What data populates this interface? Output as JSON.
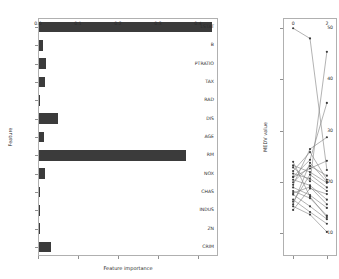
{
  "figure": {
    "width": 339,
    "height": 279,
    "background": "#ffffff",
    "bar_color": "#3b3b3b",
    "line_color": "#7f7f7f",
    "marker_color": "#3b3b3b"
  },
  "chart_data": [
    {
      "type": "bar",
      "orientation": "horizontal",
      "title": "",
      "xlabel": "Feature importance",
      "ylabel": "Feature",
      "xlim": [
        0.0,
        0.45
      ],
      "xticks": [
        0.0,
        0.1,
        0.2,
        0.3,
        0.4
      ],
      "xticklabels": [
        "0.0",
        "0.1",
        "0.2",
        "0.3",
        "0.4"
      ],
      "grid": false,
      "categories": [
        "LSTAT",
        "B",
        "PTRATIO",
        "TAX",
        "RAD",
        "DIS",
        "AGE",
        "RM",
        "NOX",
        "CHAS",
        "INDUS",
        "ZN",
        "CRIM"
      ],
      "values": [
        0.432,
        0.011,
        0.018,
        0.016,
        0.002,
        0.047,
        0.012,
        0.368,
        0.014,
        0.001,
        0.003,
        0.0005,
        0.031
      ]
    },
    {
      "type": "line",
      "title": "",
      "xlabel": "",
      "ylabel": "MEDV value",
      "xlim": [
        -0.6,
        2.6
      ],
      "ylim": [
        5.5,
        52
      ],
      "xticks": [
        0,
        2
      ],
      "xticklabels": [
        "0",
        "2"
      ],
      "yticks": [
        10,
        20,
        30,
        40,
        50
      ],
      "yticklabels": [
        "10",
        "20",
        "30",
        "40",
        "50"
      ],
      "grid": false,
      "marker": "o",
      "series": [
        {
          "name": "s1",
          "x": [
            0,
            1,
            2
          ],
          "values": [
            50.0,
            48.0,
            22.3
          ]
        },
        {
          "name": "s2",
          "x": [
            0,
            1,
            2
          ],
          "values": [
            23.2,
            21.9,
            19.8
          ]
        },
        {
          "name": "s3",
          "x": [
            0,
            1,
            2
          ],
          "values": [
            22.1,
            25.8,
            20.4
          ]
        },
        {
          "name": "s4",
          "x": [
            0,
            1,
            2
          ],
          "values": [
            21.6,
            20.6,
            18.2
          ]
        },
        {
          "name": "s5",
          "x": [
            0,
            1,
            2
          ],
          "values": [
            20.4,
            19.3,
            16.5
          ]
        },
        {
          "name": "s6",
          "x": [
            0,
            1,
            2
          ],
          "values": [
            19.9,
            23.1,
            21.2
          ]
        },
        {
          "name": "s7",
          "x": [
            0,
            1,
            2
          ],
          "values": [
            18.9,
            17.4,
            14.9
          ]
        },
        {
          "name": "s8",
          "x": [
            0,
            1,
            2
          ],
          "values": [
            18.2,
            16.8,
            13.4
          ]
        },
        {
          "name": "s9",
          "x": [
            0,
            1,
            2
          ],
          "values": [
            17.5,
            15.2,
            12.7
          ]
        },
        {
          "name": "s10",
          "x": [
            0,
            1,
            2
          ],
          "values": [
            16.5,
            14.1,
            11.8
          ]
        },
        {
          "name": "s11",
          "x": [
            0,
            1,
            2
          ],
          "values": [
            15.2,
            13.6,
            10.2
          ]
        },
        {
          "name": "s12",
          "x": [
            0,
            1,
            2
          ],
          "values": [
            14.5,
            18.7,
            17.6
          ]
        },
        {
          "name": "s13",
          "x": [
            0,
            1,
            2
          ],
          "values": [
            20.9,
            22.6,
            24.1
          ]
        },
        {
          "name": "s14",
          "x": [
            0,
            1,
            2
          ],
          "values": [
            19.4,
            26.4,
            28.7
          ]
        },
        {
          "name": "s15",
          "x": [
            0,
            1,
            2
          ],
          "values": [
            21.0,
            24.3,
            35.4
          ]
        },
        {
          "name": "s16",
          "x": [
            0,
            1,
            2
          ],
          "values": [
            22.8,
            20.1,
            45.4
          ]
        },
        {
          "name": "s17",
          "x": [
            0,
            1,
            2
          ],
          "values": [
            17.8,
            19.0,
            15.6
          ]
        },
        {
          "name": "s18",
          "x": [
            0,
            1,
            2
          ],
          "values": [
            16.1,
            21.4,
            18.9
          ]
        },
        {
          "name": "s19",
          "x": [
            0,
            1,
            2
          ],
          "values": [
            15.6,
            23.7,
            20.0
          ]
        },
        {
          "name": "s20",
          "x": [
            0,
            1,
            2
          ],
          "values": [
            23.9,
            17.1,
            13.1
          ]
        }
      ]
    }
  ]
}
